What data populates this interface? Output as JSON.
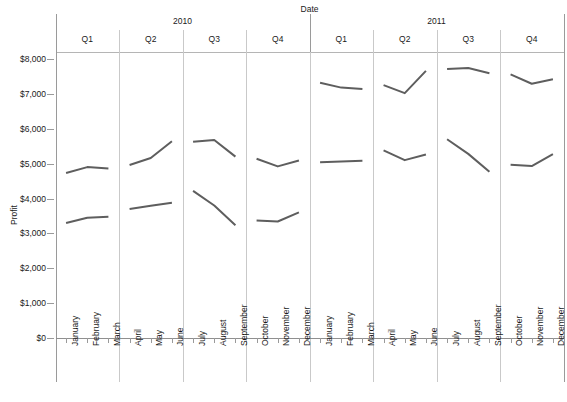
{
  "chart_data": {
    "type": "line",
    "title": "",
    "xlabel": "Date",
    "ylabel": "Profit",
    "ylim": [
      0,
      8000
    ],
    "yticks": [
      0,
      1000,
      2000,
      3000,
      4000,
      5000,
      6000,
      7000,
      8000
    ],
    "ytick_labels": [
      "$0",
      "$1,000",
      "$2,000",
      "$3,000",
      "$4,000",
      "$5,000",
      "$6,000",
      "$7,000",
      "$8,000"
    ],
    "grid": false,
    "legend": "none",
    "line_color": "#5e5e5e",
    "panel_levels": {
      "years": [
        "2010",
        "2011"
      ],
      "quarters": [
        "Q1",
        "Q2",
        "Q3",
        "Q4",
        "Q1",
        "Q2",
        "Q3",
        "Q4"
      ]
    },
    "categories": [
      "January",
      "February",
      "March",
      "April",
      "May",
      "June",
      "July",
      "August",
      "September",
      "October",
      "November",
      "December",
      "January",
      "February",
      "March",
      "April",
      "May",
      "June",
      "July",
      "August",
      "September",
      "October",
      "November",
      "December"
    ],
    "series": [
      {
        "name": "upper",
        "values": [
          4730,
          4900,
          4860,
          4960,
          5160,
          5640,
          5630,
          5680,
          5200,
          5140,
          4920,
          5090,
          7320,
          7180,
          7140,
          7250,
          7020,
          7660,
          7710,
          7740,
          7590,
          7560,
          7290,
          7420
        ]
      },
      {
        "name": "lower",
        "values": [
          3300,
          3450,
          3480,
          3700,
          3790,
          3880,
          4220,
          3800,
          3230,
          3370,
          3340,
          3600,
          5040,
          5060,
          5080,
          5380,
          5100,
          5260,
          5700,
          5280,
          4770,
          4970,
          4930,
          5270
        ]
      }
    ]
  },
  "axes": {
    "x_title": "Date",
    "y_title": "Profit"
  }
}
